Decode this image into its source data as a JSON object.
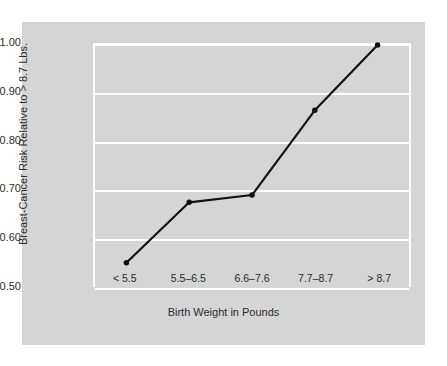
{
  "chart_data": {
    "type": "line",
    "title": "",
    "xlabel": "Birth Weight in Pounds",
    "ylabel": "Breast-Cancer Risk Relative to > 8.7 Lbs.",
    "categories": [
      "< 5.5",
      "5.5–6.5",
      "6.6–7.6",
      "7.7–8.7",
      "> 8.7"
    ],
    "values": [
      0.55,
      0.675,
      0.69,
      0.865,
      1.0
    ],
    "ylim": [
      0.5,
      1.0
    ],
    "yticks": [
      "0.50",
      "0.60",
      "0.70",
      "0.80",
      "0.90",
      "1.00"
    ],
    "ytick_values": [
      0.5,
      0.6,
      0.7,
      0.8,
      0.9,
      1.0
    ],
    "grid": true,
    "legend": "none",
    "series": [
      {
        "name": "Breast-Cancer Risk Relative to > 8.7 Lbs.",
        "values": [
          0.55,
          0.675,
          0.69,
          0.865,
          1.0
        ]
      }
    ],
    "colors": {
      "panel_background": "#d5d5d5",
      "page_background": "#ffffff",
      "grid": "#ffffff",
      "line": "#111111",
      "marker": "#111111",
      "text": "#2b2b2b"
    }
  }
}
